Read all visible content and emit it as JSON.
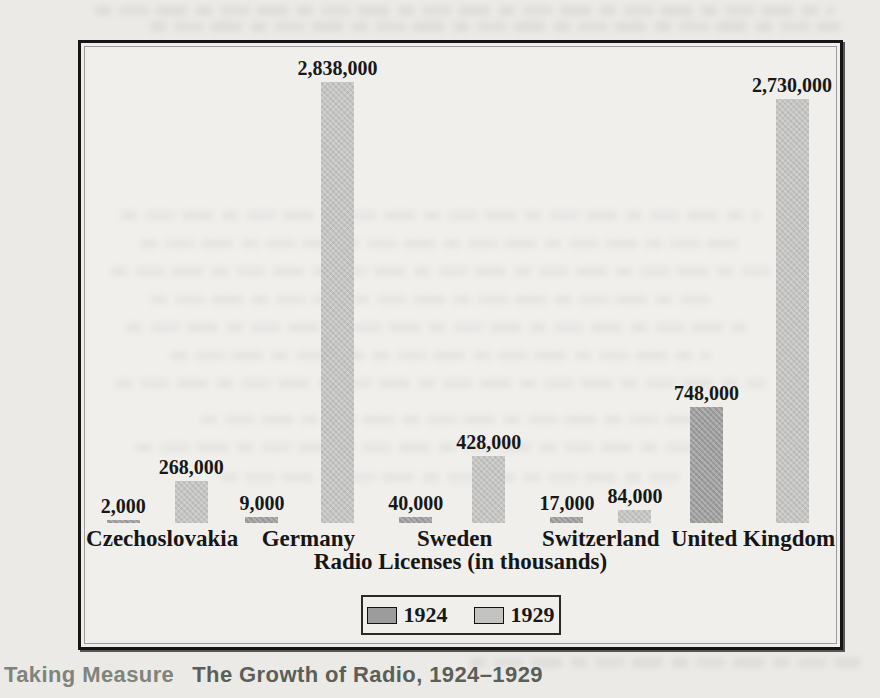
{
  "page": {
    "background_color": "#ebeae7",
    "frame_background": "#f0efec"
  },
  "caption": {
    "lead": "Taking Measure",
    "title": "The Growth of Radio, 1924–1929"
  },
  "chart_data": {
    "type": "bar",
    "title": "",
    "xlabel": "Radio Licenses (in thousands)",
    "ylabel": "",
    "categories": [
      "Czechoslovakia",
      "Germany",
      "Sweden",
      "Switzerland",
      "United Kingdom"
    ],
    "series": [
      {
        "name": "1924",
        "color": "#9c9c9c",
        "values": [
          2000,
          9000,
          40000,
          17000,
          748000
        ],
        "value_labels": [
          "2,000",
          "9,000",
          "40,000",
          "17,000",
          "748,000"
        ]
      },
      {
        "name": "1929",
        "color": "#c3c3c2",
        "values": [
          268000,
          2838000,
          428000,
          84000,
          2730000
        ],
        "value_labels": [
          "268,000",
          "2,838,000",
          "428,000",
          "84,000",
          "2,730,000"
        ]
      }
    ],
    "legend": {
      "position": "bottom-center",
      "entries": [
        "1924",
        "1929"
      ]
    },
    "ylim": [
      0,
      2838000
    ],
    "grid": false,
    "axes_shown": false
  }
}
